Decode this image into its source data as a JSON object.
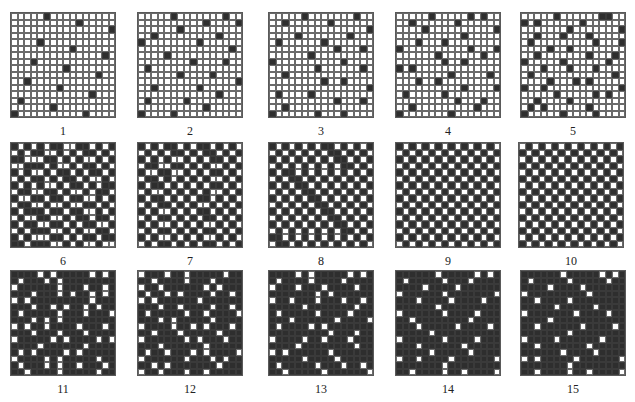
{
  "figure": {
    "grid_size": 16,
    "colors": {
      "dark": "#2e2e2e",
      "light": "#ffffff",
      "line": "#6a6a6a"
    },
    "panels": [
      {
        "label": "1",
        "x": 10,
        "y": 12,
        "rows": [
          "0000010000000000",
          "0000000000100000",
          "0000000000000001",
          "0000000000000000",
          "0000100000000000",
          "0000000001000000",
          "0000000000000010",
          "0001000000000000",
          "0000000010000000",
          "0000000000000100",
          "0010000000000000",
          "0000000100000000",
          "0000000000001000",
          "0100000000000000",
          "0000001000000000",
          "1000000000010000"
        ]
      },
      {
        "label": "2",
        "x": 137,
        "y": 12,
        "rows": [
          "0000010000000100",
          "0000000000100001",
          "0000001000000000",
          "0010000000001000",
          "1000000001000000",
          "0000000000000010",
          "0000100000000000",
          "0000000010000100",
          "0100000000000000",
          "0000001000010000",
          "0000000000000001",
          "0010000001000000",
          "0000000000001000",
          "0100000100000000",
          "0000000000100000",
          "1000010000000000"
        ]
      },
      {
        "label": "3",
        "x": 268,
        "y": 12,
        "rows": [
          "0000010000000100",
          "0010000001000000",
          "0000000000000001",
          "0000100000001000",
          "0100000010000000",
          "0000000000100010",
          "0000001000000000",
          "1000000000010000",
          "0000000100000010",
          "0010000000000000",
          "0000000010010000",
          "0000000000000001",
          "0100001000000000",
          "0000000000100010",
          "0010000000000000",
          "1000000100010000"
        ]
      },
      {
        "label": "4",
        "x": 395,
        "y": 12,
        "rows": [
          "0000010000010100",
          "0010000001000000",
          "0000100000000001",
          "0000000000100000",
          "0001000100000000",
          "1000000000010001",
          "0000001000000100",
          "0000000100100000",
          "1010000000000000",
          "0000000010000010",
          "0001001000000000",
          "0000000000100001",
          "0100000100000000",
          "0000000001000100",
          "0010000000001000",
          "1000000010000000"
        ]
      },
      {
        "label": "5",
        "x": 520,
        "y": 12,
        "rows": [
          "0000010000001100",
          "1010000001000000",
          "0000000100000001",
          "0010001000100000",
          "0100000000010001",
          "0000100100000000",
          "0010000000100010",
          "1000001000000100",
          "0001000100010000",
          "0100000000000010",
          "0000100010100000",
          "1001000000000001",
          "0000010000010100",
          "0010000100000000",
          "0101000000100000",
          "1000001000010000"
        ]
      },
      {
        "label": "6",
        "x": 10,
        "y": 142,
        "rows": [
          "1010101100110101",
          "0101100101011010",
          "1100011010100101",
          "0011101001011010",
          "1010010110101101",
          "0101101011010010",
          "1010100101101011",
          "0110011010010110",
          "1001101101100101",
          "0110010010011010",
          "1011101101100101",
          "0100110010110110",
          "1011001101011001",
          "0101110010100110",
          "1010001101011011",
          "1101110010100100"
        ]
      },
      {
        "label": "7",
        "x": 137,
        "y": 142,
        "rows": [
          "1010110101101010",
          "0101011010110101",
          "1010100101011010",
          "0110011010100101",
          "1001100101011010",
          "0110101010100101",
          "1011010101011010",
          "0100101010100101",
          "1011010101101010",
          "0101101010010101",
          "1010010101101010",
          "0101101010110101",
          "1010010101001010",
          "0101101010110101",
          "1010010101001010",
          "0101101010110101"
        ]
      },
      {
        "label": "8",
        "x": 268,
        "y": 142,
        "rows": [
          "1010101011010101",
          "0101010101101010",
          "1010101010110101",
          "0101010101011010",
          "1011010101010101",
          "0101101010101010",
          "1010110101010101",
          "0101011010101010",
          "1010101101010101",
          "0101010110101010",
          "1010101011010101",
          "0101010101101010",
          "1010101010110101",
          "0101010101011010",
          "1101010101010101",
          "0110101010101010"
        ]
      },
      {
        "label": "9",
        "x": 395,
        "y": 142,
        "rows": [
          "1010101010101010",
          "0101010101010101",
          "1010101010101010",
          "0101010101010101",
          "1010101010101010",
          "0101010101010101",
          "1010101010101010",
          "0101010101010101",
          "1010101010101010",
          "0101010101010101",
          "1010101010101010",
          "0101010101010101",
          "1010101010101010",
          "0101010101010101",
          "1010101010101010",
          "0101010101010101"
        ]
      },
      {
        "label": "10",
        "x": 518,
        "y": 142,
        "rows": [
          "0101010101010101",
          "1010101010101010",
          "0101010101010101",
          "1010101010101010",
          "0101010101010101",
          "1010101010101010",
          "0101010101010101",
          "1010101010101010",
          "0101010101010101",
          "1010101010101010",
          "0101010101010101",
          "1010101010101010",
          "0101010101010101",
          "1010101010101010",
          "0101010101010101",
          "1010101010101010"
        ]
      },
      {
        "label": "11",
        "x": 10,
        "y": 270,
        "rows": [
          "1111010111110101",
          "1011101011111111",
          "0111111011101101",
          "1110111010110101",
          "0101111111110111",
          "1110110101101011",
          "1011111011101110",
          "1110101011111111",
          "0101101111011101",
          "1110111011101111",
          "0111110101111010",
          "1111011111101111",
          "1010111101011111",
          "0111101011111011",
          "1011101011011101",
          "1101111011111011"
        ]
      },
      {
        "label": "12",
        "x": 137,
        "y": 270,
        "rows": [
          "0111011011111011",
          "1101111011101111",
          "0110111111010111",
          "1011010111101101",
          "0101111110111111",
          "1110110111101101",
          "1011111011011110",
          "1110101111101111",
          "0111101101011101",
          "1101110111110111",
          "0111111010111011",
          "1110111111011111",
          "1011011101011110",
          "0111111011101011",
          "1101011111110111",
          "0110111011011111"
        ]
      },
      {
        "label": "13",
        "x": 268,
        "y": 270,
        "rows": [
          "1111010111110101",
          "1011110111101111",
          "0111011101111011",
          "1111111010111111",
          "0110111011101101",
          "1111101111111011",
          "1011111011110111",
          "1110111111011110",
          "1011110101111111",
          "1111111110111011",
          "0111101101110111",
          "1111011111111011",
          "0101111110111111",
          "1111101111011111",
          "1011111011101101",
          "1101111101111110"
        ]
      },
      {
        "label": "14",
        "x": 395,
        "y": 270,
        "rows": [
          "1111110111110101",
          "1011111011101111",
          "1111011110111111",
          "0111111011111110",
          "1110111101111011",
          "1111110111111111",
          "0111111011110111",
          "1101111111101111",
          "1110111110111101",
          "1111101111111111",
          "0111111011110111",
          "1110111111011111",
          "1111101111101111",
          "0110111101111110",
          "1111111011111111",
          "1101111011011110"
        ]
      },
      {
        "label": "15",
        "x": 520,
        "y": 270,
        "rows": [
          "1111110111110101",
          "1011111011111011",
          "1111011110111111",
          "0111111111011111",
          "1101111011111111",
          "1111101111101111",
          "0111111101111011",
          "1111011111111111",
          "1101111110111101",
          "1111111011111111",
          "0111101111110111",
          "1101111111011111",
          "1111110111101111",
          "0101111101111110",
          "1111111011111111",
          "1101111011011110"
        ]
      }
    ]
  }
}
